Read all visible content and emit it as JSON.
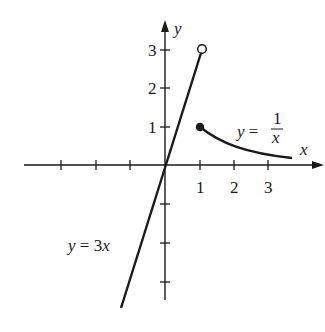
{
  "figure": {
    "axes": {
      "x_label": "x",
      "y_label": "y",
      "x_tick_labels": [
        "1",
        "2",
        "3"
      ],
      "y_tick_labels": [
        "1",
        "2",
        "3"
      ]
    },
    "curves": [
      {
        "name": "line",
        "label_lhs": "y = ",
        "label_rhs": "3x",
        "equation": "y = 3x"
      },
      {
        "name": "reciprocal",
        "label_lhs": "y = ",
        "num": "1",
        "den": "x",
        "equation": "y = 1/x"
      }
    ],
    "points": [
      {
        "label": "open-circle",
        "x": 1,
        "y": 3,
        "filled": false
      },
      {
        "label": "closed-dot",
        "x": 1,
        "y": 1,
        "filled": true
      }
    ],
    "colors": {
      "ink": "#1a1a1a",
      "background": "#ffffff"
    }
  }
}
